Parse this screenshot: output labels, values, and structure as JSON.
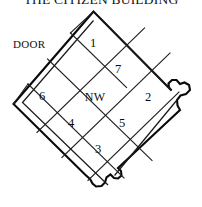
{
  "title": "THE CITIZEN BUILDING",
  "labels": {
    "door": "DOOR",
    "center": "NW"
  },
  "colors": {
    "background": "#ffffff",
    "wall_stroke": "#0a0a0a",
    "partition_stroke": "#202020",
    "text": "#0d0d0d"
  },
  "rooms": [
    {
      "id": "room-1",
      "label": "1",
      "x": 93,
      "y": 44
    },
    {
      "id": "room-7",
      "label": "7",
      "x": 118,
      "y": 70
    },
    {
      "id": "room-2",
      "label": "2",
      "x": 146,
      "y": 98
    },
    {
      "id": "room-5",
      "label": "5",
      "x": 121,
      "y": 124
    },
    {
      "id": "room-3",
      "label": "3",
      "x": 98,
      "y": 148
    },
    {
      "id": "room-4",
      "label": "4",
      "x": 72,
      "y": 123
    },
    {
      "id": "room-6",
      "label": "6",
      "x": 42,
      "y": 97
    },
    {
      "id": "room-nw",
      "label": "NW",
      "x": 95,
      "y": 98
    }
  ],
  "features": {
    "right_bay": "rounded-bay-projection",
    "bottom_bay": "rounded-bay-projection",
    "orientation": "diamond-rotated-plan"
  }
}
